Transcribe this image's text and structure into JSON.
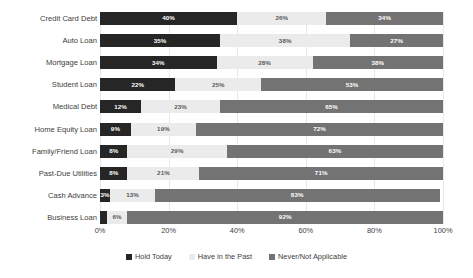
{
  "chart_data": {
    "type": "bar",
    "orientation": "horizontal",
    "stacked": true,
    "stack_mode": "percent",
    "title": "",
    "subtitle": "",
    "xlabel": "",
    "ylabel": "",
    "xlim": [
      0,
      100
    ],
    "xticks": [
      "0%",
      "20%",
      "40%",
      "60%",
      "80%",
      "100%"
    ],
    "xtick_values": [
      0,
      20,
      40,
      60,
      80,
      100
    ],
    "grid": true,
    "grid_axis": "x",
    "legend_position": "bottom",
    "categories": [
      "Credit Card Debt",
      "Auto Loan",
      "Mortgage Loan",
      "Student Loan",
      "Medical Debt",
      "Home Equity Loan",
      "Family/Friend Loan",
      "Past-Due Utilities",
      "Cash Advance",
      "Business Loan"
    ],
    "series": [
      {
        "name": "Hold Today",
        "color": "#262626",
        "values": [
          40,
          35,
          34,
          22,
          12,
          9,
          8,
          8,
          3,
          2
        ],
        "labels": [
          "40%",
          "35%",
          "34%",
          "22%",
          "12%",
          "9%",
          "8%",
          "8%",
          "3%",
          ""
        ]
      },
      {
        "name": "Have in the Past",
        "color": "#ebebeb",
        "values": [
          26,
          38,
          28,
          25,
          23,
          19,
          29,
          21,
          13,
          6
        ],
        "labels": [
          "26%",
          "38%",
          "28%",
          "25%",
          "23%",
          "19%",
          "29%",
          "21%",
          "13%",
          "6%"
        ]
      },
      {
        "name": "Never/Not Applicable",
        "color": "#737373",
        "values": [
          34,
          27,
          38,
          53,
          65,
          72,
          63,
          71,
          83,
          92
        ],
        "labels": [
          "34%",
          "27%",
          "38%",
          "53%",
          "65%",
          "72%",
          "63%",
          "71%",
          "83%",
          "92%"
        ]
      }
    ]
  },
  "legend": {
    "items": [
      {
        "label": "Hold Today",
        "color": "#262626"
      },
      {
        "label": "Have in the Past",
        "color": "#ebebeb"
      },
      {
        "label": "Never/Not Applicable",
        "color": "#737373"
      }
    ]
  }
}
